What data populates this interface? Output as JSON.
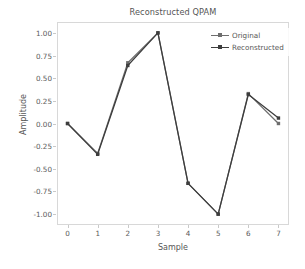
{
  "chart_data": {
    "type": "line",
    "title": "Reconstructed QPAM",
    "xlabel": "Sample",
    "ylabel": "Amplitude",
    "x": [
      0,
      1,
      2,
      3,
      4,
      5,
      6,
      7
    ],
    "xlim": [
      -0.35,
      7.35
    ],
    "ylim": [
      -1.12,
      1.12
    ],
    "xticks": [
      "0",
      "1",
      "2",
      "3",
      "4",
      "5",
      "6",
      "7"
    ],
    "yticks": [
      "1.00",
      "0.75",
      "0.50",
      "0.25",
      "0.00",
      "-0.25",
      "-0.50",
      "-0.75",
      "-1.00"
    ],
    "ytick_values": [
      1.0,
      0.75,
      0.5,
      0.25,
      0.0,
      -0.25,
      -0.5,
      -0.75,
      -1.0
    ],
    "grid": false,
    "legend_position": "upper right",
    "series": [
      {
        "name": "Original",
        "color": "#6e6e6e",
        "marker": "square",
        "values": [
          0.0,
          -0.33,
          0.67,
          1.0,
          -0.66,
          -1.0,
          0.33,
          0.0
        ]
      },
      {
        "name": "Reconstructed",
        "color": "#3d3d3d",
        "marker": "square",
        "values": [
          0.0,
          -0.34,
          0.64,
          1.0,
          -0.66,
          -1.0,
          0.32,
          0.06
        ]
      }
    ]
  },
  "legend": {
    "items": [
      {
        "label": "Original"
      },
      {
        "label": "Reconstructed"
      }
    ]
  },
  "colors": {
    "background": "#ffffff",
    "frame": "#d8d8d8",
    "text": "#555555",
    "tick_text": "#5a5a5a"
  }
}
